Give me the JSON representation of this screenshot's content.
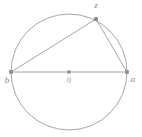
{
  "figure": {
    "kind": "geometry-diagram",
    "canvas": {
      "width": 142,
      "height": 137
    },
    "colors": {
      "background": "#ffffff",
      "stroke": "#9b9b9b",
      "chord_stroke": "#9b9b9b",
      "marker": "#8a8a8a",
      "label": "#8a8a8a"
    },
    "circle": {
      "center_x": 69,
      "center_y": 72,
      "radius": 58
    },
    "points": [
      {
        "id": "b",
        "label": "b",
        "x": 11,
        "y": 72,
        "label_x": 7,
        "label_y": 81,
        "marker": true
      },
      {
        "id": "O",
        "label": "0",
        "x": 69,
        "y": 72,
        "label_x": 69,
        "label_y": 81,
        "marker": true
      },
      {
        "id": "a",
        "label": "a",
        "x": 127,
        "y": 72,
        "label_x": 133,
        "label_y": 80,
        "marker": true
      },
      {
        "id": "z",
        "label": "z",
        "x": 96,
        "y": 19,
        "label_x": 96,
        "label_y": 6,
        "marker": true
      }
    ],
    "segments": [
      {
        "id": "diameter-ba",
        "from": "b",
        "to": "a"
      },
      {
        "id": "chord-bz",
        "from": "b",
        "to": "z"
      },
      {
        "id": "chord-za",
        "from": "z",
        "to": "a"
      }
    ]
  }
}
